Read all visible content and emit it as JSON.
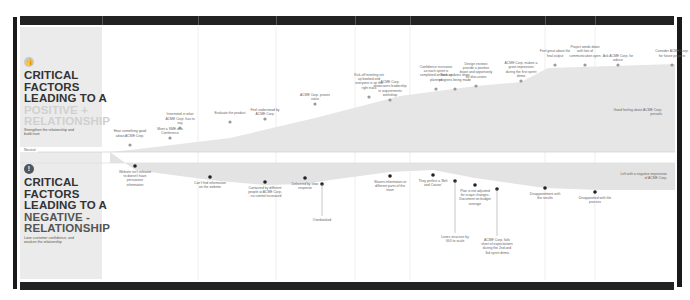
{
  "positive": {
    "icon": "thumbs-up-icon",
    "heading_lines": [
      "CRITICAL",
      "FACTORS",
      "LEADING TO A"
    ],
    "accent_lines": [
      "POSITIVE +",
      "RELATIONSHIP"
    ],
    "subtitle": "Strengthen the relationship and build trust",
    "end_note": "Good feeling about ACME Corp. prevails"
  },
  "negative": {
    "icon": "exclamation-icon",
    "heading_lines": [
      "CRITICAL",
      "FACTORS",
      "LEADING TO A"
    ],
    "accent_lines": [
      "NEGATIVE -",
      "RELATIONSHIP"
    ],
    "subtitle": "Lose customer confidence, and weaken the relationship",
    "end_note": "Left with a negative impression of ACME Corp."
  },
  "neutral_label": "Neutral",
  "colors": {
    "frame": "#1a1a1a",
    "panel": "#ebebeb",
    "positive_fill": "#e6e6e6",
    "negative_fill": "#e3e3e3",
    "positive_point": "#9a9a9a",
    "negative_point": "#222222",
    "gridline": "#e2e2e2"
  },
  "positive_points": [
    {
      "text": "Hear something good about ACME Corp.",
      "level": 0.08
    },
    {
      "text": "Meet a SME at a Conference",
      "level": 0.18
    },
    {
      "text": "Interested in what ACME Corp. has to say",
      "level": 0.26
    },
    {
      "text": "Evaluate the product",
      "level": 0.33
    },
    {
      "text": "Feel understood by ACME Corp.",
      "level": 0.38
    },
    {
      "text": "ACME Corp. proves value",
      "level": 0.5
    },
    {
      "text": "Kick-off meeting set up booked and everyone is on the right track",
      "level": 0.67
    },
    {
      "text": "ACME Corp. showcases leadership in requirements workshop",
      "level": 0.63
    },
    {
      "text": "Confidence increases as each sprint is completed on time as planned",
      "level": 0.77
    },
    {
      "text": "Bank updates show progress being made",
      "level": 0.77
    },
    {
      "text": "Design reviews provide a positive boost and opportunity for discussion",
      "level": 0.8
    },
    {
      "text": "ACME Corp. makes a great impression during the first sprint demo",
      "level": 0.86
    },
    {
      "text": "Feel great about the final output",
      "level": 0.94
    },
    {
      "text": "Project winds down with lots of communication open",
      "level": 0.94
    },
    {
      "text": "Ask ACME Corp. for advice",
      "level": 0.94
    },
    {
      "text": "Consider ACME Corp. for future projects",
      "level": 0.94
    }
  ],
  "negative_points": [
    {
      "text": "Website isn't relevant to doesn't have persuasive information",
      "level": 0.12
    },
    {
      "text": "Can't find information on the website",
      "level": 0.32
    },
    {
      "text": "Contacted by different people at ACME Corp. - no control increased",
      "level": 0.42
    },
    {
      "text": "Delivered by slow response",
      "level": 0.42
    },
    {
      "text": "Overbooked",
      "level": 0.55
    },
    {
      "text": "Shares information at different parts of the team",
      "level": 0.41
    },
    {
      "text": "They perfect a 'Belt and Cousin'",
      "level": 0.3
    },
    {
      "text": "Loses structure by GUI to scale",
      "level": 0.4
    },
    {
      "text": "Plan is not adjusted for scope changes. Document on budget overage",
      "level": 0.49
    },
    {
      "text": "ACME Corp. falls short of expectations during the 2nd and 3rd sprint demo",
      "level": 0.58
    },
    {
      "text": "Disappointment with the results",
      "level": 0.59
    },
    {
      "text": "Disappointed with the process",
      "level": 0.66
    }
  ]
}
